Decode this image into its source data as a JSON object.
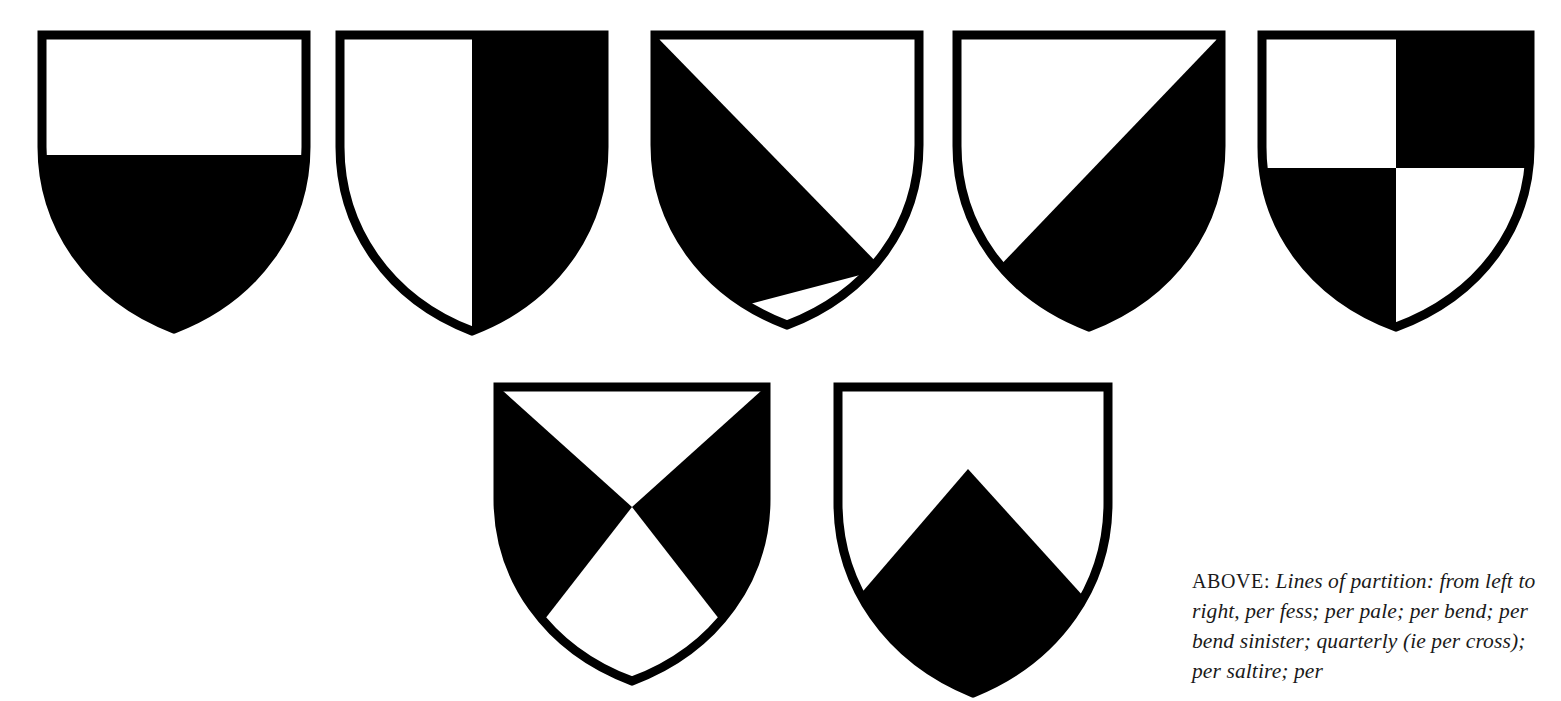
{
  "page": {
    "background_color": "#ffffff",
    "ink_color": "#000000",
    "width": 1561,
    "height": 690
  },
  "caption": {
    "lead_label": "ABOVE:",
    "text": "Lines of partition: from left to right, per fess; per pale; per bend; per bend sinister; quarterly (ie per cross); per saltire; per",
    "lines": [
      "Lines of partition: from",
      "left to right, per fess; per pale; per",
      "bend; per bend sinister; quarterly",
      "(ie per cross); per saltire; per"
    ]
  },
  "figure": {
    "shield_count": 7,
    "rows": [
      {
        "name": "top-row",
        "count": 5
      },
      {
        "name": "bottom-row",
        "count": 2
      }
    ],
    "shields": [
      {
        "index": 1,
        "partition": "per fess",
        "icon_name": "shield-per-fess-icon",
        "row": "top-row",
        "position_in_row": 1,
        "tinctures": {
          "upper": "argent",
          "lower": "sable"
        },
        "fill_colors": {
          "field_a": "#ffffff",
          "field_b": "#000000"
        },
        "outline_color": "#000000"
      },
      {
        "index": 2,
        "partition": "per pale",
        "icon_name": "shield-per-pale-icon",
        "row": "top-row",
        "position_in_row": 2,
        "tinctures": {
          "dexter": "argent",
          "sinister": "sable"
        },
        "fill_colors": {
          "field_a": "#ffffff",
          "field_b": "#000000"
        },
        "outline_color": "#000000"
      },
      {
        "index": 3,
        "partition": "per bend",
        "icon_name": "shield-per-bend-icon",
        "row": "top-row",
        "position_in_row": 3,
        "tinctures": {
          "upper_dexter": "sable",
          "lower_sinister": "argent"
        },
        "fill_colors": {
          "field_a": "#ffffff",
          "field_b": "#000000"
        },
        "outline_color": "#000000"
      },
      {
        "index": 4,
        "partition": "per bend sinister",
        "icon_name": "shield-per-bend-sinister-icon",
        "row": "top-row",
        "position_in_row": 4,
        "tinctures": {
          "upper_sinister": "argent",
          "lower_dexter": "sable"
        },
        "fill_colors": {
          "field_a": "#ffffff",
          "field_b": "#000000"
        },
        "outline_color": "#000000"
      },
      {
        "index": 5,
        "partition": "quarterly (ie per cross)",
        "icon_name": "shield-quarterly-icon",
        "row": "top-row",
        "position_in_row": 5,
        "tinctures": {
          "quarter_1": "argent",
          "quarter_2": "sable",
          "quarter_3": "sable",
          "quarter_4": "argent"
        },
        "fill_colors": {
          "field_a": "#ffffff",
          "field_b": "#000000"
        },
        "outline_color": "#000000"
      },
      {
        "index": 6,
        "partition": "per saltire",
        "icon_name": "shield-per-saltire-icon",
        "row": "bottom-row",
        "position_in_row": 1,
        "tinctures": {
          "chief": "argent",
          "dexter_flank": "sable",
          "sinister_flank": "sable",
          "base": "argent"
        },
        "fill_colors": {
          "field_a": "#ffffff",
          "field_b": "#000000"
        },
        "outline_color": "#000000"
      },
      {
        "index": 7,
        "partition": "per chevron",
        "icon_name": "shield-per-chevron-icon",
        "row": "bottom-row",
        "position_in_row": 2,
        "tinctures": {
          "chief": "argent",
          "base": "sable"
        },
        "fill_colors": {
          "field_a": "#ffffff",
          "field_b": "#000000"
        },
        "outline_color": "#000000"
      }
    ]
  }
}
